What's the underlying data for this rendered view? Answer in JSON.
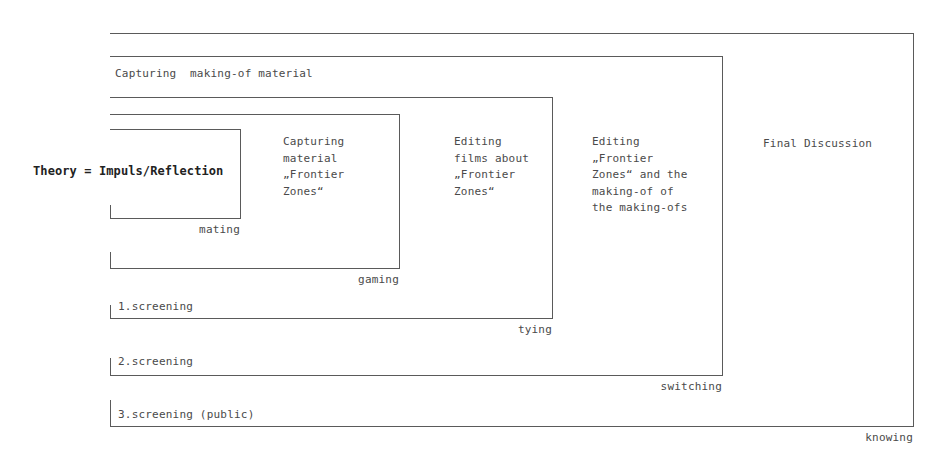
{
  "diagram": {
    "theory_label": "Theory = Impuls/Reflection",
    "top_label": "Capturing  making-of material",
    "stages": [
      {
        "id": "mating",
        "corner_label": "mating",
        "text": ""
      },
      {
        "id": "gaming",
        "corner_label": "gaming",
        "text": "Capturing\nmaterial\n„Frontier\nZones“"
      },
      {
        "id": "tying",
        "corner_label": "tying",
        "text": "Editing\nfilms about\n„Frontier\nZones“",
        "screening": "1.screening"
      },
      {
        "id": "switching",
        "corner_label": "switching",
        "text": "Editing\n„Frontier\nZones“ and the\nmaking-of of\nthe making-ofs",
        "screening": "2.screening"
      },
      {
        "id": "knowing",
        "corner_label": "knowing",
        "text": "Final Discussion",
        "screening": "3.screening (public)"
      }
    ],
    "colors": {
      "line": "#5a5a5a",
      "text": "#4a4a4a",
      "theory_text": "#222222",
      "background": "#ffffff"
    }
  }
}
